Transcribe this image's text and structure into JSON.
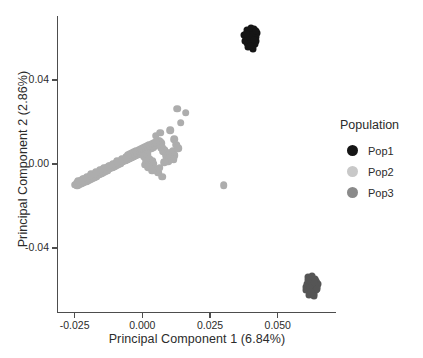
{
  "chart_data": {
    "type": "scatter",
    "title": "",
    "xlabel": "Principal Component 1 (6.84%)",
    "ylabel": "Principal Component 2 (2.86%)",
    "xlim": [
      -0.0315,
      0.0715
    ],
    "ylim": [
      -0.0705,
      0.0705
    ],
    "xticks": [
      -0.025,
      0.0,
      0.025,
      0.05
    ],
    "xticklabels": [
      "-0.025",
      "0.000",
      "0.025",
      "0.050"
    ],
    "yticks": [
      0.04,
      0.0,
      -0.04
    ],
    "yticklabels": [
      "0.04",
      "0.00",
      "-0.04"
    ],
    "grid": false,
    "legend": {
      "title": "Population",
      "position": "right",
      "entries": [
        {
          "name": "Pop1",
          "color": "#151515"
        },
        {
          "name": "Pop2",
          "color": "#c8c8c8"
        },
        {
          "name": "Pop3",
          "color": "#8a8a8a"
        }
      ]
    },
    "series": [
      {
        "name": "Pop1",
        "color": "#151515",
        "marker_size": 7,
        "points": [
          [
            0.04,
            0.062
          ],
          [
            0.0408,
            0.0632
          ],
          [
            0.0392,
            0.0628
          ],
          [
            0.0415,
            0.0616
          ],
          [
            0.0386,
            0.061
          ],
          [
            0.0402,
            0.0605
          ],
          [
            0.041,
            0.0596
          ],
          [
            0.0394,
            0.0592
          ],
          [
            0.042,
            0.0604
          ],
          [
            0.0382,
            0.0598
          ],
          [
            0.0398,
            0.064
          ],
          [
            0.0412,
            0.0644
          ],
          [
            0.0388,
            0.0578
          ],
          [
            0.0404,
            0.0572
          ],
          [
            0.0418,
            0.0584
          ],
          [
            0.0376,
            0.0614
          ],
          [
            0.0424,
            0.0624
          ],
          [
            0.0396,
            0.0566
          ],
          [
            0.0408,
            0.056
          ],
          [
            0.0386,
            0.0636
          ],
          [
            0.0416,
            0.0572
          ],
          [
            0.038,
            0.0588
          ],
          [
            0.04,
            0.0584
          ],
          [
            0.0406,
            0.0618
          ],
          [
            0.0392,
            0.0604
          ],
          [
            0.0414,
            0.059
          ],
          [
            0.0384,
            0.062
          ],
          [
            0.0402,
            0.0648
          ],
          [
            0.042,
            0.0634
          ],
          [
            0.039,
            0.0556
          ],
          [
            0.0408,
            0.055
          ],
          [
            0.0398,
            0.0562
          ]
        ]
      },
      {
        "name": "Pop3",
        "color": "#555555",
        "marker_size": 7,
        "points": [
          [
            0.0625,
            -0.057
          ],
          [
            0.0632,
            -0.0558
          ],
          [
            0.0618,
            -0.0562
          ],
          [
            0.064,
            -0.0576
          ],
          [
            0.0612,
            -0.058
          ],
          [
            0.0628,
            -0.0588
          ],
          [
            0.0636,
            -0.0594
          ],
          [
            0.062,
            -0.0598
          ],
          [
            0.0644,
            -0.0566
          ],
          [
            0.0608,
            -0.0572
          ],
          [
            0.0624,
            -0.0548
          ],
          [
            0.0638,
            -0.0546
          ],
          [
            0.0614,
            -0.0606
          ],
          [
            0.063,
            -0.061
          ],
          [
            0.0646,
            -0.0584
          ],
          [
            0.0604,
            -0.0588
          ],
          [
            0.065,
            -0.0574
          ],
          [
            0.0622,
            -0.0616
          ],
          [
            0.0634,
            -0.062
          ],
          [
            0.0612,
            -0.054
          ],
          [
            0.0642,
            -0.0556
          ],
          [
            0.0606,
            -0.06
          ],
          [
            0.0626,
            -0.058
          ],
          [
            0.0632,
            -0.0564
          ],
          [
            0.0618,
            -0.059
          ],
          [
            0.064,
            -0.0602
          ],
          [
            0.061,
            -0.0552
          ],
          [
            0.0628,
            -0.0534
          ],
          [
            0.0646,
            -0.0596
          ],
          [
            0.0616,
            -0.0624
          ],
          [
            0.0634,
            -0.0628
          ],
          [
            0.0624,
            -0.0612
          ]
        ]
      },
      {
        "name": "Pop2",
        "color": "#adadad",
        "marker_size": 7.6,
        "points": [
          [
            -0.0248,
            -0.0098
          ],
          [
            -0.0243,
            -0.0092
          ],
          [
            -0.0238,
            -0.009
          ],
          [
            -0.0234,
            -0.0086
          ],
          [
            -0.023,
            -0.0082
          ],
          [
            -0.0226,
            -0.0088
          ],
          [
            -0.0222,
            -0.0078
          ],
          [
            -0.0218,
            -0.008
          ],
          [
            -0.0214,
            -0.0072
          ],
          [
            -0.021,
            -0.0076
          ],
          [
            -0.0206,
            -0.0068
          ],
          [
            -0.0202,
            -0.007
          ],
          [
            -0.0198,
            -0.0062
          ],
          [
            -0.0194,
            -0.0066
          ],
          [
            -0.019,
            -0.0058
          ],
          [
            -0.0186,
            -0.006
          ],
          [
            -0.0182,
            -0.0052
          ],
          [
            -0.0178,
            -0.0056
          ],
          [
            -0.0174,
            -0.0048
          ],
          [
            -0.017,
            -0.005
          ],
          [
            -0.0166,
            -0.0042
          ],
          [
            -0.0162,
            -0.0044
          ],
          [
            -0.0158,
            -0.0036
          ],
          [
            -0.0154,
            -0.0038
          ],
          [
            -0.015,
            -0.003
          ],
          [
            -0.0146,
            -0.0034
          ],
          [
            -0.0142,
            -0.0026
          ],
          [
            -0.0138,
            -0.0028
          ],
          [
            -0.0134,
            -0.002
          ],
          [
            -0.013,
            -0.0024
          ],
          [
            -0.0126,
            -0.0016
          ],
          [
            -0.0122,
            -0.0018
          ],
          [
            -0.0118,
            -0.001
          ],
          [
            -0.0114,
            -0.0014
          ],
          [
            -0.011,
            -0.0006
          ],
          [
            -0.0106,
            -0.0008
          ],
          [
            -0.0102,
            0.0
          ],
          [
            -0.0098,
            -0.0002
          ],
          [
            -0.0094,
            0.0006
          ],
          [
            -0.009,
            0.0002
          ],
          [
            -0.0086,
            0.001
          ],
          [
            -0.0082,
            0.0008
          ],
          [
            -0.0078,
            0.0016
          ],
          [
            -0.0074,
            0.0012
          ],
          [
            -0.007,
            0.002
          ],
          [
            -0.0066,
            0.0018
          ],
          [
            -0.0062,
            0.0026
          ],
          [
            -0.0058,
            0.0022
          ],
          [
            -0.0054,
            0.003
          ],
          [
            -0.005,
            0.0028
          ],
          [
            -0.0046,
            0.0036
          ],
          [
            -0.0042,
            0.0032
          ],
          [
            -0.0038,
            0.004
          ],
          [
            -0.0034,
            0.0038
          ],
          [
            -0.003,
            0.0046
          ],
          [
            -0.0026,
            0.0042
          ],
          [
            -0.0022,
            0.005
          ],
          [
            -0.0018,
            0.0048
          ],
          [
            -0.0014,
            0.0056
          ],
          [
            -0.001,
            0.0052
          ],
          [
            -0.0006,
            0.006
          ],
          [
            -0.0002,
            0.0058
          ],
          [
            0.0002,
            0.0066
          ],
          [
            0.0006,
            0.0062
          ],
          [
            0.001,
            0.007
          ],
          [
            0.0014,
            0.0068
          ],
          [
            0.0018,
            0.0076
          ],
          [
            0.0022,
            0.0072
          ],
          [
            0.0026,
            0.008
          ],
          [
            0.003,
            0.0078
          ],
          [
            0.0034,
            0.0086
          ],
          [
            0.0038,
            0.0082
          ],
          [
            -0.024,
            -0.0104
          ],
          [
            -0.0232,
            -0.0096
          ],
          [
            -0.0224,
            -0.0094
          ],
          [
            -0.0216,
            -0.0086
          ],
          [
            -0.0208,
            -0.0084
          ],
          [
            -0.02,
            -0.0078
          ],
          [
            -0.0192,
            -0.0072
          ],
          [
            -0.0184,
            -0.0068
          ],
          [
            -0.0176,
            -0.0062
          ],
          [
            -0.0168,
            -0.0058
          ],
          [
            -0.016,
            -0.005
          ],
          [
            -0.0152,
            -0.0046
          ],
          [
            -0.0144,
            -0.004
          ],
          [
            -0.0136,
            -0.0034
          ],
          [
            -0.0128,
            -0.003
          ],
          [
            -0.012,
            -0.0022
          ],
          [
            -0.0112,
            -0.0018
          ],
          [
            -0.0104,
            -0.0012
          ],
          [
            -0.0096,
            -0.0006
          ],
          [
            -0.0088,
            0.0
          ],
          [
            -0.008,
            0.0004
          ],
          [
            -0.0072,
            0.001
          ],
          [
            -0.0064,
            0.0016
          ],
          [
            -0.0056,
            0.002
          ],
          [
            -0.0048,
            0.0026
          ],
          [
            -0.004,
            0.003
          ],
          [
            -0.0032,
            0.0036
          ],
          [
            -0.0024,
            0.004
          ],
          [
            -0.0016,
            0.0046
          ],
          [
            -0.0008,
            0.005
          ],
          [
            0.0,
            0.0056
          ],
          [
            0.0008,
            0.006
          ],
          [
            0.0016,
            0.0066
          ],
          [
            0.0024,
            0.007
          ],
          [
            0.0032,
            0.0076
          ],
          [
            0.004,
            0.008
          ],
          [
            -0.0236,
            -0.0082
          ],
          [
            -0.022,
            -0.007
          ],
          [
            -0.0204,
            -0.006
          ],
          [
            -0.0188,
            -0.005
          ],
          [
            -0.0172,
            -0.004
          ],
          [
            -0.0156,
            -0.0028
          ],
          [
            -0.014,
            -0.0018
          ],
          [
            -0.0124,
            -0.0008
          ],
          [
            -0.0108,
            0.0002
          ],
          [
            -0.0092,
            0.0012
          ],
          [
            -0.0076,
            0.0022
          ],
          [
            -0.006,
            0.0032
          ],
          [
            -0.0044,
            0.0042
          ],
          [
            -0.0028,
            0.0052
          ],
          [
            -0.0012,
            0.006
          ],
          [
            0.0004,
            0.0072
          ],
          [
            0.002,
            0.0082
          ],
          [
            0.0036,
            0.009
          ],
          [
            0.0044,
            0.0088
          ],
          [
            0.0048,
            0.0094
          ],
          [
            0.0052,
            0.0092
          ],
          [
            0.0056,
            0.0098
          ],
          [
            0.006,
            0.0102
          ],
          [
            0.0042,
            0.01
          ],
          [
            0.0034,
            0.0096
          ],
          [
            0.0026,
            0.0092
          ],
          [
            0.0018,
            0.0086
          ],
          [
            0.001,
            0.0082
          ],
          [
            0.0002,
            0.0078
          ],
          [
            -0.0006,
            0.0072
          ],
          [
            -0.0014,
            0.0068
          ],
          [
            -0.0022,
            0.0062
          ],
          [
            -0.003,
            0.0058
          ],
          [
            -0.0038,
            0.0052
          ],
          [
            -0.0046,
            0.0048
          ],
          [
            -0.0054,
            0.0042
          ],
          [
            0.0062,
            0.0108
          ],
          [
            0.0066,
            0.0104
          ],
          [
            0.0058,
            0.011
          ],
          [
            0.005,
            0.0106
          ],
          [
            0.007,
            0.0098
          ],
          [
            0.0064,
            0.009
          ],
          [
            0.0072,
            0.0086
          ],
          [
            0.0068,
            0.008
          ],
          [
            0.0074,
            0.0074
          ],
          [
            0.008,
            0.0068
          ],
          [
            0.0076,
            0.0062
          ],
          [
            0.0084,
            0.0058
          ],
          [
            0.0088,
            0.0052
          ],
          [
            0.0092,
            0.0046
          ],
          [
            0.0086,
            0.004
          ],
          [
            0.0094,
            0.0036
          ],
          [
            0.0098,
            0.003
          ],
          [
            0.009,
            0.0026
          ],
          [
            0.01,
            0.002
          ],
          [
            0.0096,
            0.0014
          ],
          [
            0.0104,
            0.0046
          ],
          [
            0.0108,
            0.0038
          ],
          [
            0.0102,
            0.0054
          ],
          [
            0.0106,
            0.0028
          ],
          [
            0.0128,
            0.0264
          ],
          [
            0.016,
            0.0244
          ],
          [
            0.0142,
            0.0196
          ],
          [
            0.0104,
            0.016
          ],
          [
            0.0118,
            0.0118
          ],
          [
            0.0124,
            0.0092
          ],
          [
            0.0066,
            0.015
          ],
          [
            0.005,
            0.0134
          ],
          [
            0.002,
            0.0046
          ],
          [
            0.0006,
            0.0034
          ],
          [
            0.0014,
            0.0018
          ],
          [
            0.0026,
            0.0026
          ],
          [
            0.0038,
            0.0012
          ],
          [
            0.001,
            -0.0004
          ],
          [
            0.003,
            -0.0008
          ],
          [
            0.0042,
            0.0002
          ],
          [
            0.0022,
            -0.0016
          ],
          [
            0.0048,
            -0.0024
          ],
          [
            0.0058,
            -0.0042
          ],
          [
            0.0074,
            -0.006
          ],
          [
            0.03,
            -0.01
          ],
          [
            0.0036,
            -0.0032
          ],
          [
            0.0064,
            -0.0018
          ],
          [
            0.008,
            0.0008
          ],
          [
            0.0112,
            0.0062
          ],
          [
            0.012,
            0.0042
          ],
          [
            0.0116,
            0.0022
          ],
          [
            0.0132,
            0.0074
          ]
        ]
      }
    ]
  },
  "axes": {
    "x_title": "Principal Component 1 (6.84%)",
    "y_title": "Principal Component 2 (2.86%)"
  }
}
